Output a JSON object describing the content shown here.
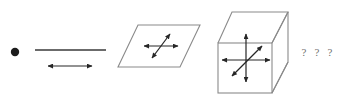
{
  "figure": {
    "background_color": "#ffffff",
    "stroke_color": "#262626",
    "outline_color": "#7a7a7a",
    "question_mark_color": "#6f6f6f",
    "width": 347,
    "height": 100
  },
  "objects": [
    {
      "id": "point",
      "name": "point",
      "dimension": 0,
      "arrow_count": 0,
      "center": {
        "x": 15,
        "y": 52
      },
      "radius": 4
    },
    {
      "id": "line",
      "name": "line-segment",
      "dimension": 1,
      "arrow_count": 1,
      "segment": {
        "x1": 35,
        "y1": 50,
        "x2": 106,
        "y2": 50
      },
      "arrows": [
        {
          "id": "line-arrow-horizontal",
          "x1": 48,
          "y1": 66,
          "x2": 92,
          "y2": 66
        }
      ]
    },
    {
      "id": "plane",
      "name": "plane-parallelogram",
      "dimension": 2,
      "arrow_count": 2,
      "vertices": "138,25 200,25 180,67 118,67",
      "arrows": [
        {
          "id": "plane-arrow-horizontal",
          "x1": 144,
          "y1": 46,
          "x2": 178,
          "y2": 46
        },
        {
          "id": "plane-arrow-diagonal",
          "x1": 152,
          "y1": 58,
          "x2": 170,
          "y2": 34
        }
      ]
    },
    {
      "id": "cube",
      "name": "cube",
      "dimension": 3,
      "arrow_count": 3,
      "front_face": {
        "x": 218,
        "y": 43,
        "width": 54,
        "height": 50
      },
      "back_top_left": {
        "x": 232,
        "y": 12
      },
      "back_top_right": {
        "x": 288,
        "y": 12
      },
      "back_bottom_right": {
        "x": 288,
        "y": 62
      },
      "arrows": [
        {
          "id": "cube-arrow-vertical",
          "x1": 246,
          "y1": 82,
          "x2": 246,
          "y2": 34
        },
        {
          "id": "cube-arrow-horizontal",
          "x1": 222,
          "y1": 60,
          "x2": 270,
          "y2": 60
        },
        {
          "id": "cube-arrow-diagonal",
          "x1": 232,
          "y1": 76,
          "x2": 262,
          "y2": 46
        }
      ]
    }
  ],
  "question_marks": [
    {
      "id": "question-mark-1",
      "label": "?",
      "x": 304,
      "y": 56
    },
    {
      "id": "question-mark-2",
      "label": "?",
      "x": 317,
      "y": 56
    },
    {
      "id": "question-mark-3",
      "label": "?",
      "x": 330,
      "y": 56
    }
  ]
}
